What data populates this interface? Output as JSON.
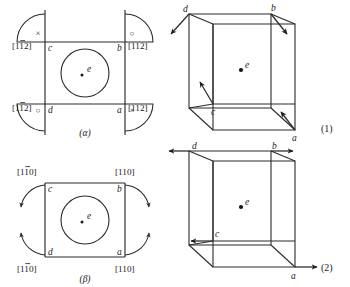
{
  "figure": {
    "kind": "crystallography-slip-system-diagram",
    "panels": [
      {
        "id": "alpha",
        "caption": "(α)",
        "center_label": "e",
        "corner_vertex_labels": {
          "top_left": "c",
          "top_right": "b",
          "bottom_left": "d",
          "bottom_right": "a"
        },
        "miller_indices": {
          "top_left": "[1̄2]",
          "top_left_plain": "[112]",
          "top_left_bar_index": 1,
          "top_right": "[112]",
          "bottom_left": "[112]",
          "bottom_left_bar_index": 1,
          "bottom_right": "[112]"
        },
        "arc_symbols": {
          "top_left": "×",
          "top_right": "○",
          "bottom_left": "○",
          "bottom_right": "×"
        },
        "arc_symbol_names": {
          "top_left": "into-page",
          "top_right": "out-of-page",
          "bottom_left": "out-of-page",
          "bottom_right": "into-page"
        }
      },
      {
        "id": "beta",
        "caption": "(β)",
        "center_label": "e",
        "corner_vertex_labels": {
          "top_left": "c",
          "top_right": "b",
          "bottom_left": "d",
          "bottom_right": "a"
        },
        "miller_indices": {
          "top_left": "[110]",
          "top_left_bar_index": 1,
          "top_right": "[110]",
          "bottom_left": "[110]",
          "bottom_left_bar_index": 1,
          "bottom_right": "[110]"
        },
        "arc_arrow_directions": {
          "top_left": "down-left",
          "top_right": "down-right",
          "bottom_left": "up-left",
          "bottom_right": "up-right"
        }
      },
      {
        "id": "cube1",
        "caption": "(1)",
        "center_label": "e",
        "vertex_labels": {
          "back_top_left": "d",
          "front_top_right": "b",
          "front_bottom_left": "c",
          "front_bottom_right": "a"
        },
        "arrow_directions": {
          "d": "down-left",
          "b": "down-right",
          "c": "up",
          "a": "down-right"
        }
      },
      {
        "id": "cube2",
        "caption": "(2)",
        "center_label": "e",
        "vertex_labels": {
          "back_top_left": "d",
          "front_top_right": "b",
          "front_bottom_left": "c",
          "front_bottom_right": "a"
        },
        "arrow_directions": {
          "d": "left",
          "b": "right",
          "c": "left",
          "a": "right"
        }
      }
    ],
    "colors": {
      "ink": "#2b2b2b",
      "background": "#ffffff"
    }
  }
}
